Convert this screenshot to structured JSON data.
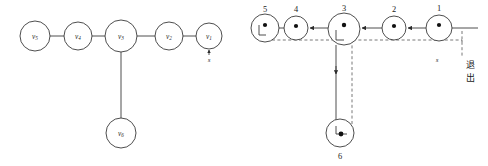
{
  "figure": {
    "background_color": "#ffffff",
    "stroke_color": "#3a3a3a",
    "dashed_color": "#555555",
    "dot_color": "#111111"
  },
  "left_diagram": {
    "name": "tree-graph",
    "nodes": [
      {
        "id": "v5",
        "label_main": "v",
        "label_sub": "5",
        "cx": 35,
        "cy": 36,
        "r": 15
      },
      {
        "id": "v4",
        "label_main": "v",
        "label_sub": "4",
        "cx": 78,
        "cy": 36,
        "r": 14
      },
      {
        "id": "v3",
        "label_main": "v",
        "label_sub": "3",
        "cx": 121,
        "cy": 36,
        "r": 16
      },
      {
        "id": "v2",
        "label_main": "v",
        "label_sub": "2",
        "cx": 169,
        "cy": 36,
        "r": 14
      },
      {
        "id": "v1",
        "label_main": "v",
        "label_sub": "1",
        "cx": 209,
        "cy": 36,
        "r": 13
      },
      {
        "id": "v6",
        "label_main": "v",
        "label_sub": "6",
        "cx": 121,
        "cy": 133,
        "r": 15
      }
    ],
    "edges": [
      {
        "from": "v5",
        "to": "v4"
      },
      {
        "from": "v4",
        "to": "v3"
      },
      {
        "from": "v3",
        "to": "v2"
      },
      {
        "from": "v2",
        "to": "v1"
      },
      {
        "from": "v3",
        "to": "v6"
      }
    ],
    "source_marker": {
      "label": "s",
      "at_node": "v1",
      "x": 209,
      "y": 60
    }
  },
  "right_diagram": {
    "name": "traversal-graph",
    "nodes": [
      {
        "id": "n5",
        "label": "5",
        "cx": 265,
        "cy": 28,
        "r": 14,
        "label_x": 265,
        "label_y": 10,
        "has_hook": true,
        "has_dot": true
      },
      {
        "id": "n4",
        "label": "4",
        "cx": 296,
        "cy": 28,
        "r": 12,
        "label_x": 296,
        "label_y": 10,
        "has_hook": false,
        "has_dot": true
      },
      {
        "id": "n3",
        "label": "3",
        "cx": 344,
        "cy": 29,
        "r": 16,
        "label_x": 344,
        "label_y": 9,
        "has_hook": true,
        "has_dot": true
      },
      {
        "id": "n2",
        "label": "2",
        "cx": 394,
        "cy": 28,
        "r": 12,
        "label_x": 394,
        "label_y": 10,
        "has_hook": false,
        "has_dot": true
      },
      {
        "id": "n1",
        "label": "1",
        "cx": 439,
        "cy": 28,
        "r": 13,
        "label_x": 439,
        "label_y": 9,
        "has_hook": false,
        "has_dot": true
      },
      {
        "id": "n6",
        "label": "6",
        "cx": 340,
        "cy": 133,
        "r": 14,
        "label_x": 340,
        "label_y": 158,
        "has_hook": true,
        "has_dot": true
      }
    ],
    "source_marker": {
      "label": "s",
      "x": 437,
      "y": 62
    },
    "exit_label": {
      "text_line1": "退",
      "text_line2": "出",
      "x": 470,
      "y": 70
    },
    "solid_arrows_direction": "right-to-left",
    "dashed_return_path": true
  }
}
